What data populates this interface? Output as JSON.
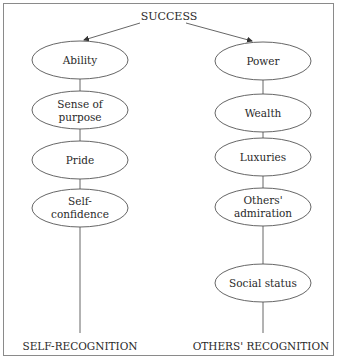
{
  "diagram": {
    "title": "SUCCESS",
    "colors": {
      "border": "#8a8a8a",
      "line": "#555555",
      "ellipse_stroke": "#555555",
      "text": "#2a2a2a",
      "background": "#ffffff"
    },
    "left": {
      "footer": "SELF-RECOGNITION",
      "nodes": [
        {
          "lines": [
            "Ability"
          ]
        },
        {
          "lines": [
            "Sense of",
            "purpose"
          ]
        },
        {
          "lines": [
            "Pride"
          ]
        },
        {
          "lines": [
            "Self-",
            "confidence"
          ]
        }
      ]
    },
    "right": {
      "footer": "OTHERS' RECOGNITION",
      "nodes": [
        {
          "lines": [
            "Power"
          ]
        },
        {
          "lines": [
            "Wealth"
          ]
        },
        {
          "lines": [
            "Luxuries"
          ]
        },
        {
          "lines": [
            "Others'",
            "admiration"
          ]
        },
        {
          "lines": [
            "Social status"
          ]
        }
      ]
    }
  }
}
